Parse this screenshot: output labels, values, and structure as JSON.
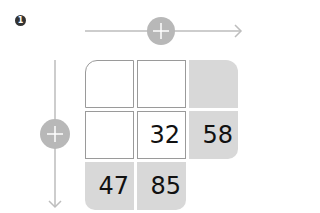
{
  "step_badge": "1",
  "colors": {
    "line": "#bdbdbd",
    "plus_circle": "#b8b8b8",
    "filled_cell": "#d8d8d8",
    "empty_border": "#9a9a9a"
  },
  "horizontal_operator": "+",
  "vertical_operator": "+",
  "grid": {
    "rows": [
      [
        "",
        "",
        ""
      ],
      [
        "",
        "32",
        "58"
      ],
      [
        "47",
        "85",
        null
      ]
    ]
  }
}
